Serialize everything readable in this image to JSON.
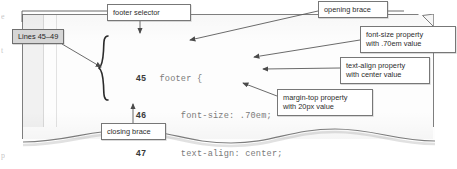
{
  "figure": {
    "type": "annotated-code-listing",
    "paper_color": "#fdfdfd",
    "ink_color": "#6e6e6e",
    "badge_fill": "#d6d6d6",
    "border_color": "#777777"
  },
  "code": {
    "language": "css",
    "lines": [
      {
        "number": "45",
        "text": "footer {"
      },
      {
        "number": "46",
        "text": "    font-size: .70em;"
      },
      {
        "number": "47",
        "text": "    text-align: center;"
      },
      {
        "number": "48",
        "text": "    margin-top: 20px;"
      },
      {
        "number": "49",
        "text": "}"
      }
    ]
  },
  "callouts": {
    "lines_badge": "Lines 45–49",
    "footer_selector": "footer selector",
    "opening_brace": "opening brace",
    "closing_brace": "closing brace",
    "font_size": {
      "line1": "font-size property",
      "line2": "with .70em value"
    },
    "text_align": {
      "line1": "text-align property",
      "line2": "with center value"
    },
    "margin_top": {
      "line1": "margin-top property",
      "line2": "with 20px value"
    }
  },
  "margin_bleed": {
    "glyph_a": "e",
    "glyph_b": "t",
    "glyph_c": "p"
  }
}
